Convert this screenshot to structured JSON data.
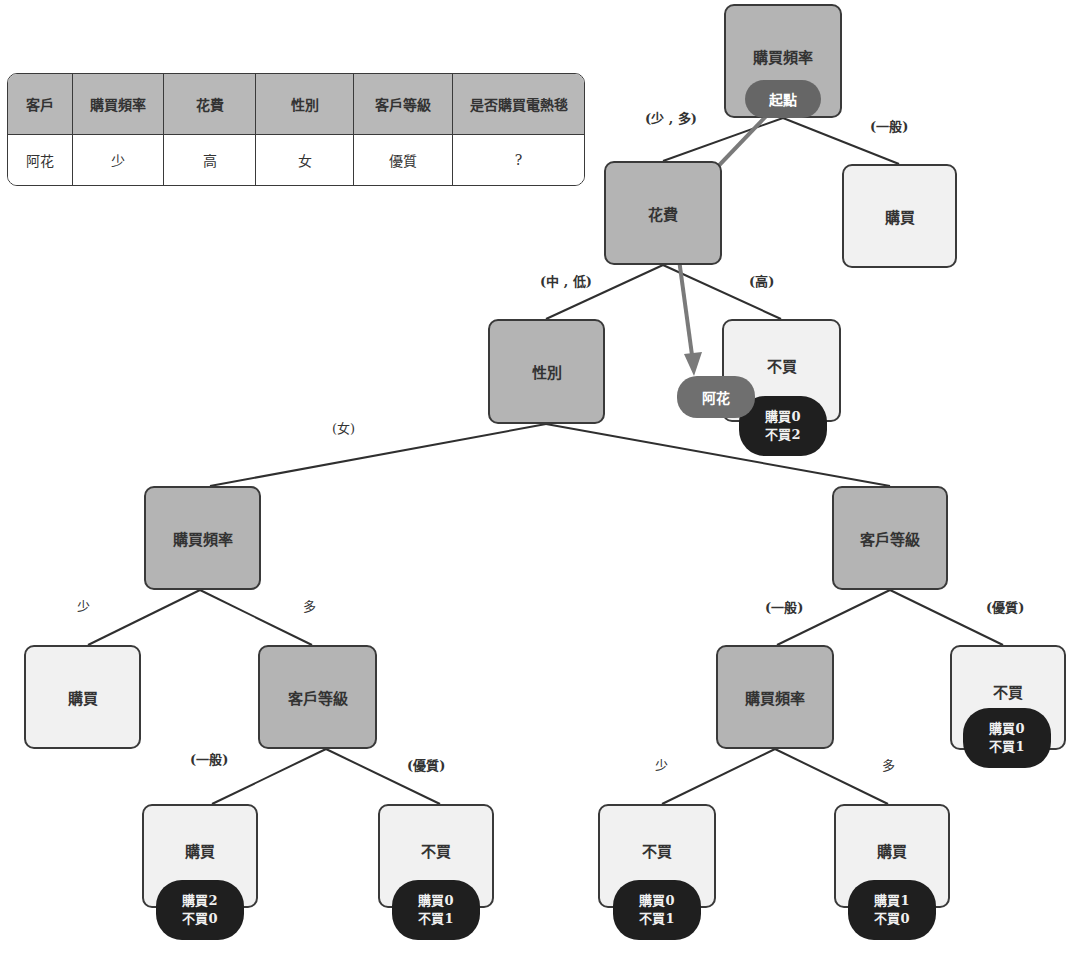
{
  "table": {
    "headers": [
      "客戶",
      "購買頻率",
      "花費",
      "性別",
      "客戶等級",
      "是否購買電熱毯"
    ],
    "row": [
      "阿花",
      "少",
      "高",
      "女",
      "優質",
      "?"
    ]
  },
  "tree": {
    "root": {
      "label": "購買頻率",
      "badge": "起點"
    },
    "spend": {
      "label": "花費"
    },
    "root_leaf_general": {
      "label": "購買"
    },
    "gender": {
      "label": "性別"
    },
    "spend_leaf_high": {
      "label": "不買",
      "count_buy": "購買0",
      "count_nobuy": "不買2",
      "badge": "阿花"
    },
    "female_freq": {
      "label": "購買頻率"
    },
    "right_level": {
      "label": "客戶等級"
    },
    "female_freq_leaf_low": {
      "label": "購買"
    },
    "female_level": {
      "label": "客戶等級"
    },
    "right_freq": {
      "label": "購買頻率"
    },
    "right_level_leaf_premium": {
      "label": "不買",
      "count_buy": "購買0",
      "count_nobuy": "不買1"
    },
    "female_level_leaf_general": {
      "label": "購買",
      "count_buy": "購買2",
      "count_nobuy": "不買0"
    },
    "female_level_leaf_premium": {
      "label": "不買",
      "count_buy": "購買0",
      "count_nobuy": "不買1"
    },
    "right_freq_leaf_low": {
      "label": "不買",
      "count_buy": "購買0",
      "count_nobuy": "不買1"
    },
    "right_freq_leaf_high": {
      "label": "購買",
      "count_buy": "購買1",
      "count_nobuy": "不買0"
    }
  },
  "edge_labels": {
    "root_left": "(少 , 多)",
    "root_right": "(一般)",
    "spend_left": "(中 , 低)",
    "spend_right": "(高)",
    "gender_left": "(女)",
    "ffreq_left": "少",
    "ffreq_right": "多",
    "flevel_left": "(一般)",
    "flevel_right": "(優質)",
    "rlevel_left": "(一般)",
    "rlevel_right": "(優質)",
    "rfreq_left": "少",
    "rfreq_right": "多"
  },
  "colors": {
    "split_node": "#b4b4b4",
    "leaf_node": "#f1f1f1",
    "count_badge": "#1f1f1f",
    "path_arrow": "#7a7a7a",
    "badge": "#6f6f6f"
  }
}
